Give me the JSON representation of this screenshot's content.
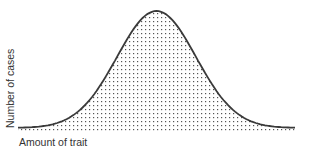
{
  "chart_data": {
    "type": "area",
    "title": "",
    "xlabel": "Amount of trait",
    "ylabel": "Number of cases",
    "distribution": "normal",
    "x": [
      -3.5,
      -3,
      -2.5,
      -2,
      -1.5,
      -1,
      -0.5,
      0,
      0.5,
      1,
      1.5,
      2,
      2.5,
      3,
      3.5
    ],
    "values": [
      0.001,
      0.004,
      0.018,
      0.054,
      0.13,
      0.242,
      0.352,
      0.399,
      0.352,
      0.242,
      0.13,
      0.054,
      0.018,
      0.004,
      0.001
    ],
    "ticks": false,
    "grid": false,
    "legend": false,
    "fill": "stipple",
    "colors": {
      "curve": "#3a3a3a",
      "fill_dots": "#555555",
      "text": "#333333"
    }
  }
}
